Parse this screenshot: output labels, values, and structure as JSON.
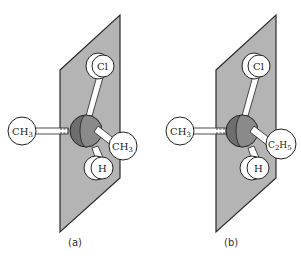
{
  "figure": {
    "panels": [
      {
        "id": "a",
        "caption": "(a)",
        "center_atom": "C",
        "substituents": {
          "top": {
            "base": "Cl",
            "sub": "",
            "tail": ""
          },
          "left": {
            "base": "CH",
            "sub": "3",
            "tail": ""
          },
          "right": {
            "base": "CH",
            "sub": "3",
            "tail": ""
          },
          "bottom": {
            "base": "H",
            "sub": "",
            "tail": ""
          }
        }
      },
      {
        "id": "b",
        "caption": "(b)",
        "center_atom": "C",
        "substituents": {
          "top": {
            "base": "Cl",
            "sub": "",
            "tail": ""
          },
          "left": {
            "base": "CH",
            "sub": "3",
            "tail": ""
          },
          "right": {
            "base": "C",
            "sub": "2",
            "tail": "H",
            "sub2": "5"
          },
          "bottom": {
            "base": "H",
            "sub": "",
            "tail": ""
          }
        }
      }
    ],
    "colors": {
      "plane_fill": "#b4b4b4",
      "plane_stroke": "#2a2a2a",
      "carbon_front": "#8a8a8a",
      "carbon_back": "#6e6e6e",
      "atom_fill": "#ffffff",
      "atom_stroke": "#222222"
    }
  }
}
